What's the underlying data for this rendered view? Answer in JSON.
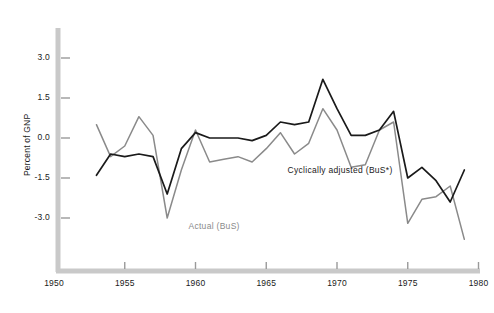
{
  "chart_data": {
    "type": "line",
    "title": "",
    "subtitle": "",
    "xlabel": "",
    "ylabel": "Percent of GNP",
    "xlim": [
      1950,
      1980
    ],
    "ylim": [
      -4.5,
      4.0
    ],
    "xticks": [
      "1950",
      "1955",
      "1960",
      "1965",
      "1970",
      "1975",
      "1980"
    ],
    "xtick_values": [
      1950,
      1955,
      1960,
      1965,
      1970,
      1975,
      1980
    ],
    "yticks": [
      "3.0",
      "1.5",
      "0.0",
      "-1.5",
      "-3.0"
    ],
    "ytick_values": [
      3.0,
      1.5,
      0.0,
      -1.5,
      -3.0
    ],
    "grid": false,
    "legend_position": "inline-annotations",
    "x": [
      1953,
      1954,
      1955,
      1956,
      1957,
      1958,
      1959,
      1960,
      1961,
      1962,
      1963,
      1964,
      1965,
      1966,
      1967,
      1968,
      1969,
      1970,
      1971,
      1972,
      1973,
      1974,
      1975,
      1976,
      1977,
      1978,
      1979
    ],
    "series": [
      {
        "name": "Actual (BuS)",
        "color": "#8a8a8a",
        "values": [
          0.5,
          -0.7,
          -0.3,
          0.8,
          0.1,
          -3.0,
          -1.2,
          0.3,
          -0.9,
          -0.8,
          -0.7,
          -0.9,
          -0.4,
          0.2,
          -0.6,
          -0.2,
          1.1,
          0.3,
          -1.1,
          -1.0,
          0.3,
          0.6,
          -3.2,
          -2.3,
          -2.2,
          -1.8,
          -3.8
        ]
      },
      {
        "name": "Cyclically adjusted (BuS*)",
        "color": "#1a1a1a",
        "values": [
          -1.4,
          -0.6,
          -0.7,
          -0.6,
          -0.7,
          -2.1,
          -0.4,
          0.2,
          0.0,
          0.0,
          0.0,
          -0.1,
          0.1,
          0.6,
          0.5,
          0.6,
          2.2,
          1.1,
          0.1,
          0.1,
          0.3,
          1.0,
          -1.5,
          -1.1,
          -1.6,
          -2.4,
          -1.2
        ]
      }
    ],
    "annotations": [
      {
        "text": "Actual (BuS)",
        "x": 1959.5,
        "y": -3.35
      },
      {
        "text": "Cyclically adjusted (BuS*)",
        "x": 1966.5,
        "y": -1.25
      }
    ]
  },
  "axis": {
    "color": "#c4c4c4",
    "tick_color": "#9a9a9a"
  }
}
